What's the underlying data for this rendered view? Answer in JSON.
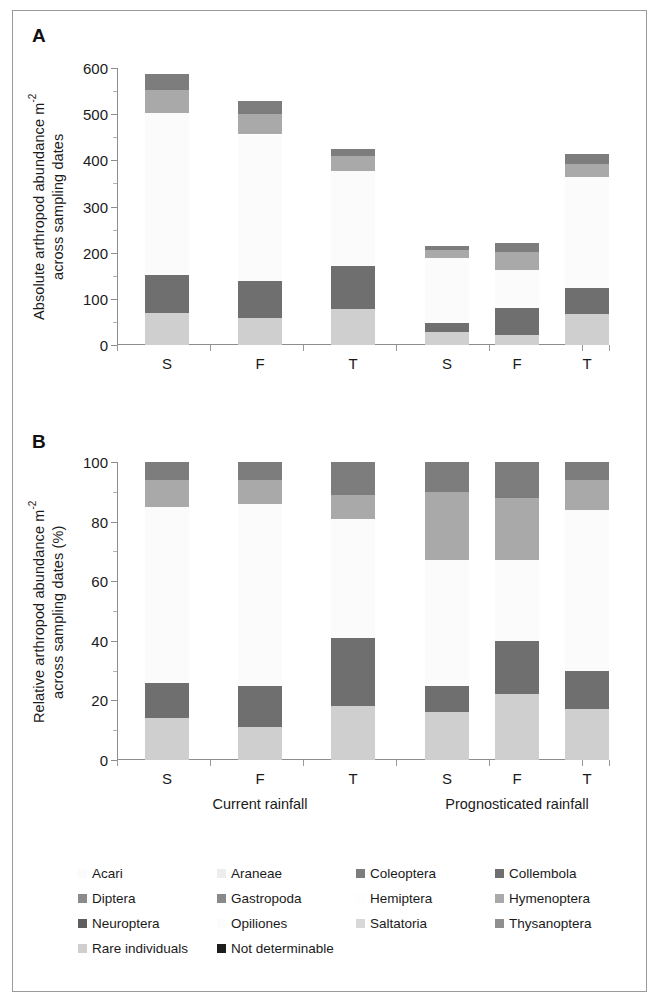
{
  "figure": {
    "panelA_letter": "A",
    "panelB_letter": "B"
  },
  "panelA": {
    "ylabel_line1": "Absolute arthropod abundance m",
    "ylabel_sup": "-2",
    "ylabel_line2": "across sampling dates"
  },
  "panelB": {
    "ylabel_line1": "Relative arthropod abundance m",
    "ylabel_sup": "-2",
    "ylabel_line2": "across sampling dates (%)"
  },
  "axis": {
    "categories": [
      "S",
      "F",
      "T",
      "S",
      "F",
      "T"
    ],
    "groups": [
      "Current rainfall",
      "Prognosticated rainfall"
    ],
    "a_ticks": [
      "0",
      "100",
      "200",
      "300",
      "400",
      "500",
      "600"
    ],
    "b_ticks": [
      "0",
      "20",
      "40",
      "60",
      "80",
      "100"
    ]
  },
  "taxa": [
    {
      "name": "Acari",
      "color": "#fbfbfb"
    },
    {
      "name": "Araneae",
      "color": "#ededed"
    },
    {
      "name": "Coleoptera",
      "color": "#7d7d7d"
    },
    {
      "name": "Collembola",
      "color": "#6f6f6f"
    },
    {
      "name": "Diptera",
      "color": "#8a8a8a"
    },
    {
      "name": "Gastropoda",
      "color": "#898989"
    },
    {
      "name": "Hemiptera",
      "color": "#fdfdfd"
    },
    {
      "name": "Hymenoptera",
      "color": "#a9a9a9"
    },
    {
      "name": "Neuroptera",
      "color": "#5e5e5e"
    },
    {
      "name": "Opiliones",
      "color": "#fcfcfc"
    },
    {
      "name": "Saltatoria",
      "color": "#d8d8d8"
    },
    {
      "name": "Thysanoptera",
      "color": "#8f8f8f"
    },
    {
      "name": "Rare individuals",
      "color": "#cfcfcf"
    },
    {
      "name": "Not determinable",
      "color": "#1d1d1d"
    }
  ],
  "chart_data": [
    {
      "type": "bar",
      "subtype": "stacked",
      "panel": "A",
      "title": "",
      "xlabel": "",
      "ylabel": "Absolute arthropod abundance m-2 across sampling dates",
      "ylim": [
        0,
        600
      ],
      "ytick_step": 100,
      "grid": false,
      "legend": "bottom",
      "categories": [
        "S",
        "F",
        "T",
        "S",
        "F",
        "T"
      ],
      "groups": [
        {
          "name": "Current rainfall",
          "categories": [
            "S",
            "F",
            "T"
          ]
        },
        {
          "name": "Prognosticated rainfall",
          "categories": [
            "S",
            "F",
            "T"
          ]
        }
      ],
      "series": [
        {
          "name": "Rare individuals",
          "color": "#cfcfcf",
          "values": [
            70,
            58,
            78,
            28,
            22,
            68
          ]
        },
        {
          "name": "Collembola",
          "color": "#6f6f6f",
          "values": [
            82,
            81,
            94,
            20,
            58,
            55
          ]
        },
        {
          "name": "Acari",
          "color": "#fbfbfb",
          "values": [
            350,
            317,
            205,
            140,
            82,
            240
          ]
        },
        {
          "name": "Hymenoptera",
          "color": "#a9a9a9",
          "values": [
            50,
            45,
            32,
            18,
            40,
            30
          ]
        },
        {
          "name": "Coleoptera",
          "color": "#7d7d7d",
          "values": [
            35,
            28,
            16,
            8,
            20,
            20
          ]
        }
      ],
      "bar_totals": [
        587,
        529,
        425,
        214,
        222,
        413
      ]
    },
    {
      "type": "bar",
      "subtype": "stacked",
      "panel": "B",
      "title": "",
      "xlabel": "",
      "ylabel": "Relative arthropod abundance m-2 across sampling dates (%)",
      "ylim": [
        0,
        100
      ],
      "ytick_step": 20,
      "grid": false,
      "legend": "bottom",
      "categories": [
        "S",
        "F",
        "T",
        "S",
        "F",
        "T"
      ],
      "groups": [
        {
          "name": "Current rainfall",
          "categories": [
            "S",
            "F",
            "T"
          ]
        },
        {
          "name": "Prognosticated rainfall",
          "categories": [
            "S",
            "F",
            "T"
          ]
        }
      ],
      "series": [
        {
          "name": "Rare individuals",
          "color": "#cfcfcf",
          "values": [
            14,
            11,
            18,
            16,
            22,
            17
          ]
        },
        {
          "name": "Collembola",
          "color": "#6f6f6f",
          "values": [
            12,
            14,
            23,
            9,
            18,
            13
          ]
        },
        {
          "name": "Acari",
          "color": "#fbfbfb",
          "values": [
            59,
            61,
            40,
            42,
            27,
            54
          ]
        },
        {
          "name": "Hymenoptera",
          "color": "#a9a9a9",
          "values": [
            9,
            8,
            8,
            23,
            21,
            10
          ]
        },
        {
          "name": "Coleoptera",
          "color": "#7d7d7d",
          "values": [
            6,
            6,
            11,
            10,
            12,
            6
          ]
        }
      ],
      "bar_totals": [
        100,
        100,
        100,
        100,
        100,
        100
      ]
    }
  ]
}
